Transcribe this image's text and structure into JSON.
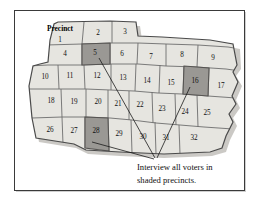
{
  "figure": {
    "title_label": "Precinct",
    "caption": {
      "line1": "Interview all voters in",
      "line2": "shaded precincts."
    },
    "colors": {
      "cell_fill": "#e6e5e0",
      "cell_fill_alt": "#dedcd6",
      "shaded_fill": "#9a9894",
      "cell_stroke": "#6d6d6d",
      "map_outline": "#4a4a4a",
      "shadow": "#b9b7b2",
      "frame": "#3a3a3a",
      "leader_line": "#1a1a1a",
      "text": "#101010",
      "background": "#ffffff"
    },
    "shaded_precincts": [
      5,
      16,
      28
    ],
    "precincts": [
      {
        "id": 1,
        "label": "1",
        "x": 46,
        "y": 30,
        "shaded": false
      },
      {
        "id": 2,
        "label": "2",
        "x": 84,
        "y": 23,
        "shaded": false
      },
      {
        "id": 3,
        "label": "3",
        "x": 111,
        "y": 22,
        "shaded": false
      },
      {
        "id": 4,
        "label": "4",
        "x": 51,
        "y": 44,
        "shaded": false
      },
      {
        "id": 5,
        "label": "5",
        "x": 81,
        "y": 43,
        "shaded": true
      },
      {
        "id": 6,
        "label": "6",
        "x": 108,
        "y": 44,
        "shaded": false
      },
      {
        "id": 7,
        "label": "7",
        "x": 137,
        "y": 47,
        "shaded": false
      },
      {
        "id": 8,
        "label": "8",
        "x": 168,
        "y": 45,
        "shaded": false
      },
      {
        "id": 9,
        "label": "9",
        "x": 199,
        "y": 48,
        "shaded": false
      },
      {
        "id": 10,
        "label": "10",
        "x": 31,
        "y": 67,
        "shaded": false
      },
      {
        "id": 11,
        "label": "11",
        "x": 56,
        "y": 66,
        "shaded": false
      },
      {
        "id": 12,
        "label": "12",
        "x": 83,
        "y": 66,
        "shaded": false
      },
      {
        "id": 13,
        "label": "13",
        "x": 109,
        "y": 68,
        "shaded": false
      },
      {
        "id": 14,
        "label": "14",
        "x": 133,
        "y": 71,
        "shaded": false
      },
      {
        "id": 15,
        "label": "15",
        "x": 157,
        "y": 73,
        "shaded": false
      },
      {
        "id": 16,
        "label": "16",
        "x": 181,
        "y": 71,
        "shaded": true
      },
      {
        "id": 17,
        "label": "17",
        "x": 207,
        "y": 76,
        "shaded": false
      },
      {
        "id": 18,
        "label": "18",
        "x": 37,
        "y": 91,
        "shaded": false
      },
      {
        "id": 19,
        "label": "19",
        "x": 60,
        "y": 92,
        "shaded": false
      },
      {
        "id": 20,
        "label": "20",
        "x": 84,
        "y": 92,
        "shaded": false
      },
      {
        "id": 21,
        "label": "21",
        "x": 104,
        "y": 94,
        "shaded": false
      },
      {
        "id": 22,
        "label": "22",
        "x": 126,
        "y": 95,
        "shaded": false
      },
      {
        "id": 23,
        "label": "23",
        "x": 148,
        "y": 99,
        "shaded": false
      },
      {
        "id": 24,
        "label": "24",
        "x": 171,
        "y": 102,
        "shaded": false
      },
      {
        "id": 25,
        "label": "25",
        "x": 193,
        "y": 103,
        "shaded": false
      },
      {
        "id": 26,
        "label": "26",
        "x": 36,
        "y": 120,
        "shaded": false
      },
      {
        "id": 27,
        "label": "27",
        "x": 60,
        "y": 121,
        "shaded": false
      },
      {
        "id": 28,
        "label": "28",
        "x": 82,
        "y": 121,
        "shaded": true
      },
      {
        "id": 29,
        "label": "29",
        "x": 105,
        "y": 124,
        "shaded": false
      },
      {
        "id": 30,
        "label": "30",
        "x": 129,
        "y": 127,
        "shaded": false
      },
      {
        "id": 31,
        "label": "31",
        "x": 152,
        "y": 128,
        "shaded": false
      },
      {
        "id": 32,
        "label": "32",
        "x": 180,
        "y": 128,
        "shaded": false
      }
    ],
    "leader_lines": [
      {
        "from_precinct": 5,
        "x1": 85,
        "y1": 48,
        "x2": 141,
        "y2": 148
      },
      {
        "from_precinct": 16,
        "x1": 176,
        "y1": 77,
        "x2": 143,
        "y2": 148
      },
      {
        "from_precinct": 28,
        "x1": 78,
        "y1": 132,
        "x2": 140,
        "y2": 149
      }
    ]
  }
}
